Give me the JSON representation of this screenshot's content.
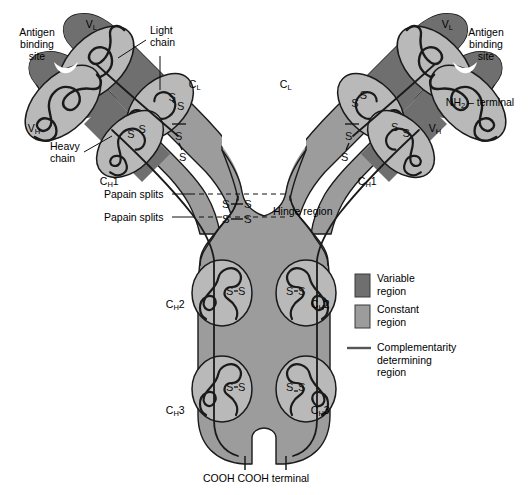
{
  "figure": {
    "colors": {
      "background": "#ffffff",
      "variable_region": "#6f6f6f",
      "constant_region": "#9c9c9c",
      "domain_blob": "#b9b9b9",
      "cdr_line": "#1a1a1a",
      "outline": "#1a1a1a",
      "divider": "#ffffff"
    }
  },
  "labels": {
    "antigen_binding_site_left": "Antigen\nbinding\nsite",
    "antigen_binding_site_right": "Antigen\nbinding\nsite",
    "vl_left": "V",
    "vl_left_sub": "L",
    "vl_right": "V",
    "vl_right_sub": "L",
    "vh_left": "V",
    "vh_left_sub": "H",
    "vh_right": "V",
    "vh_right_sub": "H",
    "cl_left": "C",
    "cl_left_sub": "L",
    "cl_right": "C",
    "cl_right_sub": "L",
    "ch1_left": "C",
    "ch1_left_sub": "H",
    "ch1_left_num": "1",
    "ch1_right": "C",
    "ch1_right_sub": "H",
    "ch1_right_num": "1",
    "ch2_left": "C",
    "ch2_left_sub": "H",
    "ch2_left_num": "2",
    "ch2_right": "C",
    "ch2_right_sub": "H",
    "ch2_right_num": "2",
    "ch3_left": "C",
    "ch3_left_sub": "H",
    "ch3_left_num": "3",
    "ch3_right": "C",
    "ch3_right_sub": "H",
    "ch3_right_num": "3",
    "light_chain": "Light\nchain",
    "heavy_chain": "Heavy\nchain",
    "papain_splits_1": "Papain splits",
    "papain_splits_2": "Papain splits",
    "hinge_region": "Hinge region",
    "nh2_terminal": "NH",
    "nh2_terminal_sub": "2",
    "nh2_terminal_rest": " – terminal",
    "cooh_terminal": "COOH COOH terminal",
    "disulfide": "S"
  },
  "legend": {
    "items": [
      {
        "marker": "swatch",
        "color": "#6f6f6f",
        "label": "Variable\nregion"
      },
      {
        "marker": "swatch",
        "color": "#9c9c9c",
        "label": "Constant\nregion"
      },
      {
        "marker": "line",
        "color": "#555555",
        "label": "Complementarity\ndetermining\nregion"
      }
    ]
  },
  "structure": {
    "chains": [
      "heavy chain",
      "heavy chain",
      "light chain",
      "light chain"
    ],
    "domains_per_heavy_chain": [
      "VH",
      "CH1",
      "CH2",
      "CH3"
    ],
    "domains_per_light_chain": [
      "VL",
      "CL"
    ],
    "disulfide_bonds_visible": 12,
    "antigen_binding_sites": 2,
    "papain_cleavage_lines": 2
  }
}
